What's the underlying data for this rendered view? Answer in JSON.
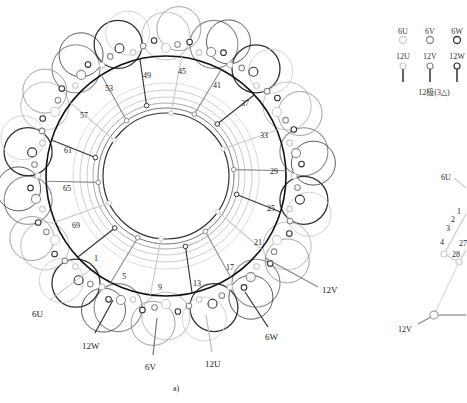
{
  "figure": {
    "caption": "a)",
    "main_diagram": {
      "description": "Circular stator winding diagram with coil arcs and slot numbers",
      "slot_labels": [
        {
          "n": "49",
          "x": 143,
          "y": 72
        },
        {
          "n": "45",
          "x": 178,
          "y": 68
        },
        {
          "n": "41",
          "x": 213,
          "y": 82
        },
        {
          "n": "37",
          "x": 241,
          "y": 100
        },
        {
          "n": "33",
          "x": 260,
          "y": 132
        },
        {
          "n": "29",
          "x": 270,
          "y": 168
        },
        {
          "n": "25",
          "x": 267,
          "y": 205
        },
        {
          "n": "21",
          "x": 254,
          "y": 239
        },
        {
          "n": "17",
          "x": 226,
          "y": 264
        },
        {
          "n": "13",
          "x": 193,
          "y": 280
        },
        {
          "n": "9",
          "x": 158,
          "y": 284
        },
        {
          "n": "5",
          "x": 122,
          "y": 273
        },
        {
          "n": "1",
          "x": 94,
          "y": 255
        },
        {
          "n": "69",
          "x": 72,
          "y": 222
        },
        {
          "n": "65",
          "x": 63,
          "y": 185
        },
        {
          "n": "61",
          "x": 64,
          "y": 147
        },
        {
          "n": "57",
          "x": 80,
          "y": 112
        },
        {
          "n": "53",
          "x": 105,
          "y": 85
        }
      ],
      "terminal_labels": [
        {
          "text": "6U",
          "x": 32,
          "y": 310
        },
        {
          "text": "12W",
          "x": 82,
          "y": 342
        },
        {
          "text": "6V",
          "x": 145,
          "y": 363
        },
        {
          "text": "12U",
          "x": 205,
          "y": 360
        },
        {
          "text": "12V",
          "x": 322,
          "y": 286
        },
        {
          "text": "6W",
          "x": 265,
          "y": 333
        }
      ]
    },
    "legend": {
      "top_row": [
        "6U",
        "6V",
        "6W"
      ],
      "bottom_row": [
        "12U",
        "12V",
        "12W"
      ],
      "title": "12极(3△)",
      "colors": {
        "U": "#c8c8c8",
        "V": "#8a8a8a",
        "W": "#333333"
      }
    },
    "side_diagram": {
      "labels": [
        {
          "text": "6U",
          "x": 441,
          "y": 174
        },
        {
          "text": "1",
          "x": 457,
          "y": 208
        },
        {
          "text": "2",
          "x": 451,
          "y": 216
        },
        {
          "text": "3",
          "x": 446,
          "y": 225
        },
        {
          "text": "4",
          "x": 440,
          "y": 239
        },
        {
          "text": "27",
          "x": 459,
          "y": 240
        },
        {
          "text": "28",
          "x": 452,
          "y": 251
        },
        {
          "text": "12V",
          "x": 398,
          "y": 326
        }
      ]
    }
  }
}
